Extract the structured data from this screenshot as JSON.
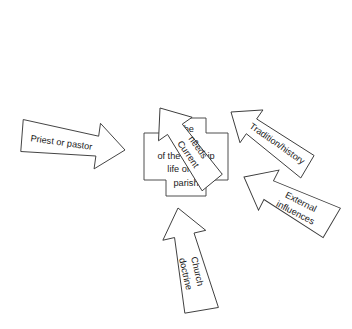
{
  "diagram": {
    "title_visible": false,
    "background_color": "#ffffff",
    "stroke_color": "#3b3b3b",
    "text_color": "#1a1a1a",
    "center": {
      "shape": "cross",
      "lines": [
        "The",
        "shape",
        "of the worship",
        "life of the",
        "parish"
      ]
    },
    "arrows": [
      {
        "id": "current-needs",
        "label_lines": [
          "Current",
          "needs"
        ],
        "direction": "points down-right toward center",
        "origin": "top-left"
      },
      {
        "id": "tradition-history",
        "label_lines": [
          "Tradition/history"
        ],
        "direction": "points down-left toward center",
        "origin": "top-right"
      },
      {
        "id": "priest-or-pastor",
        "label_lines": [
          "Priest or pastor"
        ],
        "direction": "points right toward center",
        "origin": "left"
      },
      {
        "id": "external-influences",
        "label_lines": [
          "External",
          "influences"
        ],
        "direction": "points up-left toward center",
        "origin": "bottom-right"
      },
      {
        "id": "church-doctrine",
        "label_lines": [
          "Church",
          "doctrine"
        ],
        "direction": "points up toward center",
        "origin": "bottom"
      }
    ]
  }
}
